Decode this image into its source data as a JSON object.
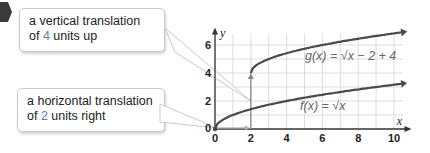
{
  "callouts": {
    "vertical": {
      "prefix": "a vertical translation",
      "line2_pre": "of ",
      "num": "4",
      "line2_post": " units up"
    },
    "horizontal": {
      "prefix": "a horizontal translation",
      "line2_pre": "of ",
      "num": "2",
      "line2_post": " units right"
    }
  },
  "icons": {
    "step_marker": "hexagon-step-icon"
  },
  "colors": {
    "curve": "#4a4a4a",
    "grid": "#d4d4d4",
    "axis": "#333333",
    "label_gray": "#666666",
    "accent_num": "#5a7fa8"
  },
  "chart_data": {
    "type": "line",
    "title": "",
    "xlabel": "x",
    "ylabel": "y",
    "xlim": [
      0,
      10.5
    ],
    "ylim": [
      0,
      6.8
    ],
    "x_ticks": [
      "0",
      "2",
      "4",
      "6",
      "8",
      "10"
    ],
    "y_ticks": [
      "0",
      "2",
      "4",
      "6"
    ],
    "grid": true,
    "series": [
      {
        "name": "f(x) = √x",
        "label_plain": "f(x) = √x",
        "x": [
          0,
          1,
          2,
          4,
          6,
          8,
          10
        ],
        "values": [
          0,
          1,
          1.41,
          2,
          2.45,
          2.83,
          3.16
        ]
      },
      {
        "name": "g(x) = √(x − 2) + 4",
        "label_plain": "g(x) = √x − 2 + 4",
        "x": [
          2,
          3,
          4,
          6,
          8,
          10
        ],
        "values": [
          4,
          5,
          5.41,
          6,
          6.45,
          6.83
        ]
      }
    ],
    "annotations": [
      {
        "type": "arrow",
        "from": [
          0,
          0
        ],
        "to": [
          2,
          0
        ],
        "text": "horizontal translation of 2 units right"
      },
      {
        "type": "arrow",
        "from": [
          2,
          0
        ],
        "to": [
          2,
          4
        ],
        "text": "vertical translation of 4 units up"
      }
    ]
  }
}
